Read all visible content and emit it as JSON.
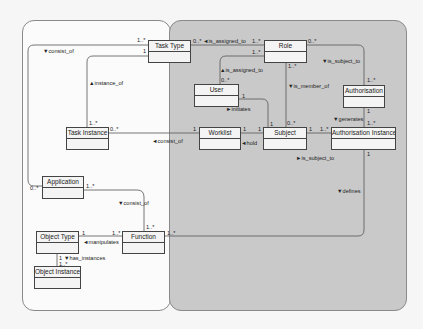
{
  "diagram": {
    "packages": [
      {
        "id": "application-package",
        "fill": "#fbfbfb"
      },
      {
        "id": "organisation-package",
        "fill": "#c9c9c9"
      }
    ],
    "classes": {
      "task_type": "Task Type",
      "role": "Role",
      "user": "User",
      "authorisation": "Authorisation",
      "task_instance": "Task Instance",
      "worklist": "Worklist",
      "subject": "Subject",
      "authorisation_instance": "Authorisation Instance",
      "application": "Application",
      "function": "Function",
      "object_type": "Object Type",
      "object_instance": "Object Instance"
    },
    "associations": {
      "consist_of_tt_app": "▼consist_of",
      "is_assigned_to_tt_role": "◄is_assigned_to",
      "instance_of": "▲instance_of",
      "is_assigned_to_user_role": "▲is_assigned_to",
      "is_subject_to_role_auth": "▼is_subject_to",
      "is_member_of": "▼is_member_of",
      "initiates": "►initiates",
      "consist_of_ti_wl": "◄consist_of",
      "hold": "◄hold",
      "generates": "▼generates",
      "is_subject_to_subj_ai": "►is_subject_to",
      "consist_of_app_func": "▼consist_of",
      "defines": "▼defines",
      "manipulates": "◄manipulates",
      "has_instances": "▼has_instances"
    },
    "multiplicities": {
      "tt_app_tt": "1..*",
      "tt_ti_tt": "1",
      "tt_role_tt": "0..*",
      "tt_role_role": "1..*",
      "user_role_role": "1..*",
      "user_role_user": "0..*",
      "role_auth_role": "0..*",
      "role_auth_auth": "1..*",
      "role_subj_role": "1..*",
      "ti_tt": "1..*",
      "ti_wl_ti": "0..*",
      "ti_wl_wl": "1",
      "user_subj_user": "1",
      "user_subj_subj": "1",
      "wl_subj_wl": "1",
      "wl_subj_subj": "1",
      "role_subj_subj": "0..*",
      "subj_ai_subj": "1",
      "subj_ai_ai": "1..*",
      "auth_ai_auth": "1",
      "auth_ai_ai": "1..*",
      "ai_func_ai": "1",
      "app_tt_app": "0..*",
      "app_func_app": "1..*",
      "app_func_func": "1..*",
      "ot_func_ot": "1",
      "ot_func_func": "1..*",
      "func_ai_func": "1..*",
      "ot_oi_ot": "1",
      "ot_oi_oi": "1..*"
    }
  }
}
